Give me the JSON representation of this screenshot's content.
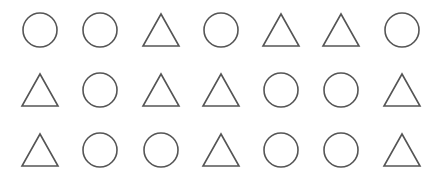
{
  "canvas": {
    "width": 444,
    "height": 186,
    "background": "#ffffff"
  },
  "style": {
    "stroke": "#555555",
    "stroke_width": 1.6,
    "fill": "none"
  },
  "grid": {
    "columns_x": [
      40,
      100,
      161,
      221,
      281,
      341,
      402
    ],
    "rows_y": [
      30,
      90,
      150
    ],
    "shape_size": {
      "circle_radius": 17,
      "triangle_half_base": 18,
      "triangle_height": 32
    },
    "rows": [
      [
        "circle",
        "circle",
        "triangle",
        "circle",
        "triangle",
        "triangle",
        "circle"
      ],
      [
        "triangle",
        "circle",
        "triangle",
        "triangle",
        "circle",
        "circle",
        "triangle"
      ],
      [
        "triangle",
        "circle",
        "circle",
        "triangle",
        "circle",
        "circle",
        "triangle"
      ]
    ]
  }
}
